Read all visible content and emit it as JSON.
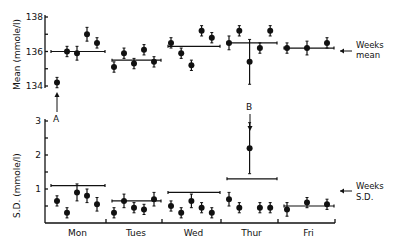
{
  "chart_data": {
    "type": "scatter",
    "title": "",
    "panels": [
      {
        "name": "mean",
        "ylabel": "Mean (mmole/l)",
        "ylim": [
          134,
          138
        ],
        "yticks": [
          134,
          136,
          138
        ],
        "ytick_labels": [
          "134",
          "136",
          "138"
        ],
        "grid": false,
        "legend": "Weeks mean",
        "days": [
          {
            "day": "Mon",
            "values": [
              134.2,
              136.0,
              135.9,
              137.0,
              136.5
            ],
            "errors": [
              0.3,
              0.3,
              0.4,
              0.4,
              0.3
            ],
            "weekly_mean": 136.0
          },
          {
            "day": "Tues",
            "values": [
              135.1,
              135.9,
              135.3,
              136.1,
              135.4
            ],
            "errors": [
              0.3,
              0.3,
              0.3,
              0.3,
              0.3
            ],
            "weekly_mean": 135.5
          },
          {
            "day": "Wed",
            "values": [
              136.5,
              135.9,
              135.2,
              137.2,
              136.8
            ],
            "errors": [
              0.3,
              0.3,
              0.3,
              0.3,
              0.3
            ],
            "weekly_mean": 136.3
          },
          {
            "day": "Thur",
            "values": [
              136.5,
              137.2,
              135.4,
              136.2,
              137.2
            ],
            "errors": [
              0.4,
              0.3,
              1.3,
              0.3,
              0.3
            ],
            "weekly_mean": 136.5
          },
          {
            "day": "Fri",
            "values": [
              136.2,
              136.2,
              136.5
            ],
            "errors": [
              0.3,
              0.4,
              0.3
            ],
            "weekly_mean": 136.2
          }
        ]
      },
      {
        "name": "sd",
        "ylabel": "S.D. (mmole/l)",
        "ylim": [
          0,
          3
        ],
        "yticks": [
          0.5,
          1,
          1.5,
          2,
          2.5,
          3
        ],
        "ytick_labels": [
          "",
          "1",
          "",
          "2",
          "",
          "3"
        ],
        "grid": false,
        "legend": "Weeks S.D.",
        "days": [
          {
            "day": "Mon",
            "values": [
              0.65,
              0.3,
              0.9,
              0.8,
              0.55
            ],
            "errors": [
              0.15,
              0.15,
              0.25,
              0.2,
              0.2
            ],
            "weekly_sd": 1.1
          },
          {
            "day": "Tues",
            "values": [
              0.3,
              0.65,
              0.45,
              0.4,
              0.7
            ],
            "errors": [
              0.15,
              0.2,
              0.15,
              0.15,
              0.2
            ],
            "weekly_sd": 0.65
          },
          {
            "day": "Wed",
            "values": [
              0.5,
              0.3,
              0.65,
              0.45,
              0.3
            ],
            "errors": [
              0.15,
              0.15,
              0.2,
              0.15,
              0.15
            ],
            "weekly_sd": 0.9
          },
          {
            "day": "Thur",
            "values": [
              0.7,
              0.45,
              2.2,
              0.45,
              0.45
            ],
            "errors": [
              0.2,
              0.15,
              0.75,
              0.15,
              0.15
            ],
            "weekly_sd": 1.3
          },
          {
            "day": "Fri",
            "values": [
              0.4,
              0.6,
              0.55
            ],
            "errors": [
              0.2,
              0.15,
              0.15
            ],
            "weekly_sd": 0.5
          }
        ]
      }
    ],
    "categories": [
      "Mon",
      "Tues",
      "Wed",
      "Thur",
      "Fri"
    ],
    "xlabel": "",
    "annotations": [
      {
        "label": "A",
        "target": "Mon point 1 mean (134.2)",
        "arrow": "up"
      },
      {
        "label": "B",
        "target": "Thur point 3 S.D. (2.2)",
        "arrow": "down"
      }
    ]
  },
  "labels": {
    "mean_axis": "Mean (mmole/l)",
    "sd_axis": "S.D. (mmole/l)",
    "weeks_mean_1": "Weeks",
    "weeks_mean_2": "mean",
    "weeks_sd_1": "Weeks",
    "weeks_sd_2": "S.D.",
    "annot_a": "A",
    "annot_b": "B"
  }
}
